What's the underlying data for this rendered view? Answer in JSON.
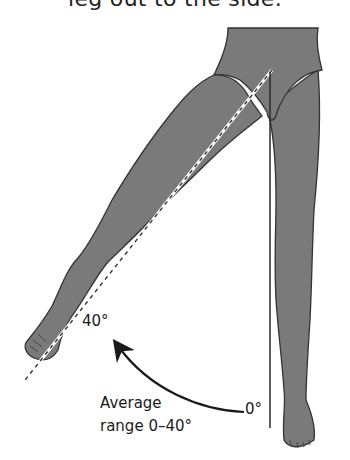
{
  "caption": {
    "title": "leg out to the side."
  },
  "diagram": {
    "labels": {
      "angle_end": "40°",
      "angle_start": "0°",
      "average_line1": "Average",
      "average_line2": "range 0–40°"
    },
    "colors": {
      "body_fill": "#7a7a7a",
      "outline": "#333333",
      "background": "#ffffff",
      "arrow": "#1a1a1a"
    },
    "elements": [
      "pelvis-briefs",
      "standing-leg",
      "raised-leg",
      "vertical-reference-line",
      "dashed-leg-axis-line",
      "curved-arrow"
    ]
  }
}
